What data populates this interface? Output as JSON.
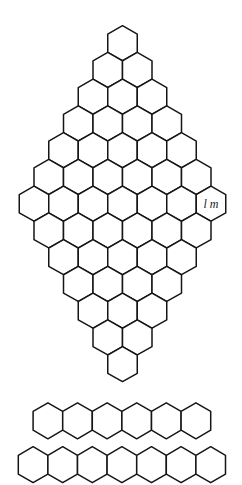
{
  "diagram": {
    "type": "hexagonal-grid",
    "hex_orientation": "pointy-top",
    "stroke_color": "#151515",
    "background": "#ffffff",
    "diamond": {
      "name": "hex-diamond",
      "row_counts": [
        1,
        2,
        3,
        4,
        5,
        6,
        7,
        6,
        5,
        4,
        3,
        2,
        1
      ],
      "center_x": 122.5,
      "first_row_center_y": 43.2,
      "row_spacing": 26.75,
      "hex_width": 29.5,
      "hex_height": 35,
      "labeled_cell": {
        "row": 6,
        "col": 6,
        "label": "l m"
      }
    },
    "strips": [
      {
        "name": "hex-strip-6",
        "count": 6,
        "center_x": 121.9,
        "center_y": 420.8,
        "hex_width": 29.6,
        "hex_height": 36
      },
      {
        "name": "hex-strip-7",
        "count": 7,
        "center_x": 121.9,
        "center_y": 464.7,
        "hex_width": 29.6,
        "hex_height": 36
      }
    ]
  }
}
